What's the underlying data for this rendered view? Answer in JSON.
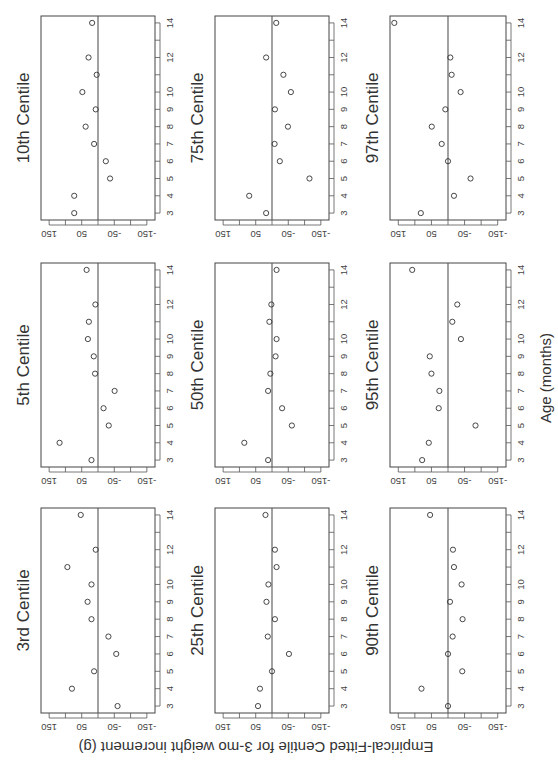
{
  "chart_data": {
    "type": "scatter",
    "orientation_note": "figure rendered rotated 90 degrees",
    "xlabel": "Age (months)",
    "ylabel": "Empirical-Fitted Centile for 3-mo weight increment (g)",
    "x_ticks": [
      3,
      4,
      5,
      6,
      7,
      8,
      9,
      10,
      11,
      12,
      13,
      14
    ],
    "x_tick_labels": [
      "3",
      "4",
      "5",
      "6",
      "7",
      "8",
      "9",
      "10",
      "",
      "12",
      "",
      "14"
    ],
    "y_ticks": [
      150,
      100,
      50,
      0,
      -50,
      -100,
      -150
    ],
    "y_tick_labels": [
      "150",
      "",
      "50",
      "",
      "-50",
      "",
      "-150"
    ],
    "xlim": [
      2.6,
      14.4
    ],
    "ylim": [
      -175,
      175
    ],
    "reference_line": 0,
    "grid": false,
    "x": [
      3,
      4,
      5,
      6,
      7,
      8,
      9,
      10,
      11,
      12,
      14
    ],
    "panels": [
      {
        "title": "10th Centile",
        "values": [
          73,
          73,
          -37,
          -24,
          12,
          38,
          7,
          48,
          4,
          29,
          18
        ]
      },
      {
        "title": "5th Centile",
        "values": [
          20,
          118,
          -33,
          -17,
          -51,
          9,
          13,
          31,
          28,
          8,
          35
        ]
      },
      {
        "title": "3rd Centile",
        "values": [
          -60,
          80,
          12,
          -56,
          -32,
          20,
          32,
          20,
          94,
          7,
          53
        ]
      },
      {
        "title": "75th Centile",
        "values": [
          18,
          70,
          -115,
          -24,
          -8,
          -49,
          -9,
          -58,
          -35,
          18,
          -13
        ]
      },
      {
        "title": "50th Centile",
        "values": [
          12,
          85,
          -61,
          -31,
          12,
          5,
          -11,
          -14,
          8,
          2,
          -14
        ]
      },
      {
        "title": "25th Centile",
        "values": [
          43,
          37,
          0,
          -52,
          13,
          -9,
          17,
          11,
          -14,
          -9,
          20
        ]
      },
      {
        "title": "97th Centile",
        "values": [
          82,
          -18,
          -68,
          0,
          19,
          49,
          8,
          -38,
          -11,
          -7,
          162
        ]
      },
      {
        "title": "95th Centile",
        "values": [
          78,
          58,
          -83,
          28,
          26,
          50,
          55,
          -39,
          -13,
          -28,
          108
        ]
      },
      {
        "title": "90th Centile",
        "values": [
          0,
          80,
          -43,
          0,
          -14,
          -44,
          -6,
          -41,
          -18,
          -15,
          54
        ]
      }
    ]
  },
  "layout": {
    "columns_x": [
      [
        41,
        155
      ],
      [
        215,
        329
      ],
      [
        390,
        506
      ]
    ],
    "rows_y": [
      [
        16,
        220
      ],
      [
        263,
        467
      ],
      [
        508,
        713
      ]
    ]
  }
}
